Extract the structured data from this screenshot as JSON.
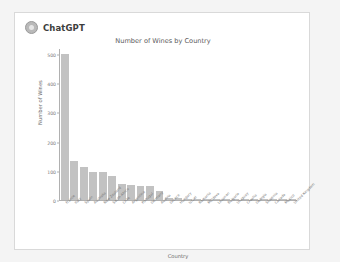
{
  "app": {
    "brand_name": "ChatGPT",
    "logo_icon": "chatgpt-logo-icon"
  },
  "colors": {
    "page_background": "#f4f4f4",
    "card_background": "#ffffff",
    "card_border": "#d9d9d9",
    "bar_fill": "#c2c2c2",
    "axis": "#b0b0b0",
    "text": "#5a5a5a"
  },
  "chart_data": {
    "type": "bar",
    "title": "Number of Wines by Country",
    "xlabel": "Country",
    "ylabel": "Number of Wines",
    "ylim": [
      0,
      520
    ],
    "yticks": [
      0,
      100,
      200,
      300,
      400,
      500
    ],
    "ytick_labels": [
      "0",
      "100",
      "200",
      "300",
      "400",
      "500"
    ],
    "grid": false,
    "legend": "none",
    "xtick_rotation": -45,
    "categories": [
      "France",
      "Italy",
      "Spain",
      "Australia",
      "New Zealand",
      "South Africa",
      "Chile",
      "Argentina",
      "Portugal",
      "Germany",
      "Austria",
      "Greece",
      "Hungary",
      "Israel",
      "Romania",
      "Moldova",
      "Lebanon",
      "Bulgaria",
      "Uruguay",
      "Croatia",
      "Georgia",
      "Slovenia",
      "Canada",
      "Mexico",
      "United Kingdom"
    ],
    "values": [
      500,
      132,
      113,
      97,
      95,
      82,
      55,
      51,
      48,
      47,
      32,
      7,
      6,
      5,
      4,
      4,
      3,
      3,
      2,
      2,
      2,
      2,
      1,
      1,
      1
    ]
  }
}
